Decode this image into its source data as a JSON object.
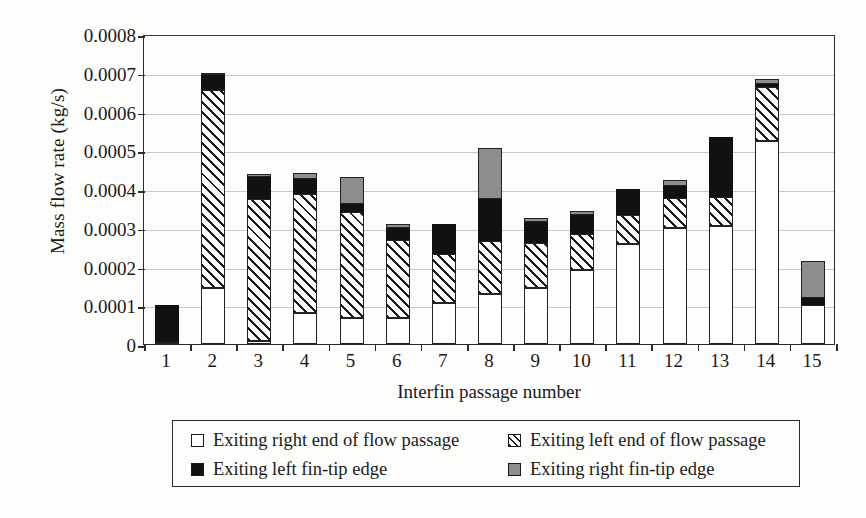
{
  "chart_data": {
    "type": "bar",
    "stacked": true,
    "title": "",
    "xlabel": "Interfin passage number",
    "ylabel": "Mass flow rate (kg/s)",
    "ylim": [
      0,
      0.0008
    ],
    "ytick_labels": [
      "0",
      "0.0001",
      "0.0002",
      "0.0003",
      "0.0004",
      "0.0005",
      "0.0006",
      "0.0007",
      "0.0008"
    ],
    "ytick_values": [
      0,
      0.0001,
      0.0002,
      0.0003,
      0.0004,
      0.0005,
      0.0006,
      0.0007,
      0.0008
    ],
    "grid": "horizontal",
    "legend_position": "below-plot",
    "categories": [
      "1",
      "2",
      "3",
      "4",
      "5",
      "6",
      "7",
      "8",
      "9",
      "10",
      "11",
      "12",
      "13",
      "14",
      "15"
    ],
    "series": [
      {
        "name": "Exiting right end of flow passage",
        "fill": "white",
        "values": [
          5e-06,
          0.000145,
          8e-06,
          7.9e-05,
          6.8e-05,
          6.6e-05,
          0.000105,
          0.000128,
          0.000145,
          0.000192,
          0.000258,
          0.0003,
          0.000304,
          0.000525,
          0.0001
        ]
      },
      {
        "name": "Exiting left end of flow passage",
        "fill": "diagonal-hatch",
        "values": [
          0.0,
          0.00051,
          0.000367,
          0.000307,
          0.000273,
          0.000203,
          0.000127,
          0.000137,
          0.000116,
          9.1e-05,
          7.4e-05,
          7.8e-05,
          7.5e-05,
          0.000138,
          0.0
        ]
      },
      {
        "name": "Exiting left fin-tip edge",
        "fill": "black",
        "values": [
          9.5e-05,
          4e-05,
          5.5e-05,
          4.1e-05,
          2e-05,
          3.1e-05,
          7.8e-05,
          0.00011,
          5.3e-05,
          4.9e-05,
          6.8e-05,
          3e-05,
          0.000154,
          8e-06,
          1.8e-05
        ]
      },
      {
        "name": "Exiting right fin-tip edge",
        "fill": "gray",
        "values": [
          0.0,
          5e-06,
          9e-06,
          1.4e-05,
          7.1e-05,
          9e-06,
          0.0,
          0.00013,
          1e-05,
          1e-05,
          0.0,
          1.4e-05,
          0.0,
          1.4e-05,
          9.7e-05
        ]
      }
    ],
    "totals": [
      0.0001,
      0.0007,
      0.000439,
      0.000441,
      0.000432,
      0.000309,
      0.00031,
      0.000505,
      0.000324,
      0.000342,
      0.0004,
      0.000422,
      0.000533,
      0.000685,
      0.000215
    ]
  },
  "legend": {
    "items": [
      {
        "label": "Exiting right end of flow passage",
        "fill": "white"
      },
      {
        "label": "Exiting left end of flow passage",
        "fill": "hatch"
      },
      {
        "label": "Exiting left fin-tip edge",
        "fill": "black"
      },
      {
        "label": "Exiting right fin-tip edge",
        "fill": "gray"
      }
    ]
  },
  "colors": {
    "axis": "#2b2b2b",
    "grid": "#c9c9c9",
    "black_series": "#111111",
    "gray_series": "#8d8d8d",
    "background": "#fdfdfb"
  }
}
